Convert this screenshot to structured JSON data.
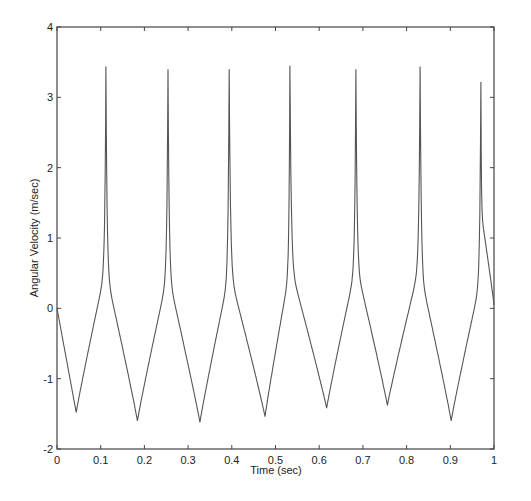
{
  "chart_data": {
    "type": "line",
    "title": "",
    "xlabel": "Time (sec)",
    "ylabel": "Angular Velocity (m/sec)",
    "xlim": [
      0,
      1
    ],
    "ylim": [
      -2,
      4
    ],
    "xticks": [
      "0",
      "0.1",
      "0.2",
      "0.3",
      "0.4",
      "0.5",
      "0.6",
      "0.7",
      "0.8",
      "0.9",
      "1"
    ],
    "yticks": [
      "-2",
      "-1",
      "0",
      "1",
      "2",
      "3",
      "4"
    ],
    "grid": false,
    "legend": null,
    "line_color": "#555555",
    "series": [
      {
        "name": "angular velocity",
        "start": {
          "x": 0.0,
          "y": 0.0
        },
        "troughs": [
          {
            "x": 0.044,
            "y": -1.48
          },
          {
            "x": 0.184,
            "y": -1.6
          },
          {
            "x": 0.327,
            "y": -1.62
          },
          {
            "x": 0.476,
            "y": -1.54
          },
          {
            "x": 0.617,
            "y": -1.42
          },
          {
            "x": 0.756,
            "y": -1.38
          },
          {
            "x": 0.902,
            "y": -1.6
          }
        ],
        "peaks": [
          {
            "x": 0.112,
            "y": 3.44
          },
          {
            "x": 0.254,
            "y": 3.4
          },
          {
            "x": 0.394,
            "y": 3.4
          },
          {
            "x": 0.533,
            "y": 3.45
          },
          {
            "x": 0.684,
            "y": 3.4
          },
          {
            "x": 0.831,
            "y": 3.44
          },
          {
            "x": 0.97,
            "y": 3.22
          }
        ],
        "end": {
          "x": 1.0,
          "y": 0.05
        }
      }
    ]
  }
}
